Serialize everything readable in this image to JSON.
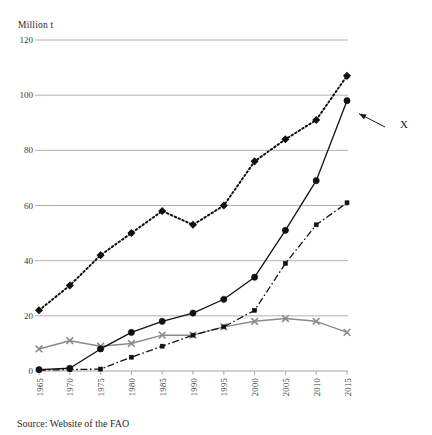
{
  "figure": {
    "unit_label": "Million t",
    "source_note": "Source: Website of the FAO",
    "annotation_label": "X"
  },
  "chart_data": {
    "type": "line",
    "title": "",
    "subtitle": "",
    "xlabel": "",
    "ylabel": "Million t",
    "ylim": [
      0,
      120
    ],
    "yticks": [
      0,
      20,
      40,
      60,
      80,
      100,
      120
    ],
    "ytick_labels": [
      "0",
      "20",
      "40",
      "60",
      "80",
      "100",
      "120"
    ],
    "grid": true,
    "grid_axis": "y",
    "legend": "none",
    "legend_position": "none",
    "x": [
      1965,
      1970,
      1975,
      1980,
      1985,
      1990,
      1995,
      2000,
      2005,
      2010,
      2015
    ],
    "categories": [
      "1965",
      "1970",
      "1975",
      "1980",
      "1985",
      "1990",
      "1995",
      "2000",
      "2005",
      "2010",
      "2015"
    ],
    "series": [
      {
        "name": "series-dotted-diamond",
        "marker": "diamond",
        "line_style": "dotted",
        "color": "#111111",
        "values": [
          22,
          31,
          42,
          50,
          58,
          53,
          60,
          76,
          84,
          91,
          107
        ]
      },
      {
        "name": "series-solid-circle",
        "marker": "circle",
        "line_style": "solid",
        "color": "#111111",
        "annotated": true,
        "values": [
          0.5,
          1,
          8,
          14,
          18,
          21,
          26,
          34,
          51,
          69,
          98
        ]
      },
      {
        "name": "series-dashdot-square",
        "marker": "square",
        "line_style": "dash-dot",
        "color": "#111111",
        "values": [
          0.3,
          0.5,
          0.7,
          5,
          9,
          13,
          16,
          22,
          39,
          53,
          61
        ]
      },
      {
        "name": "series-gray-cross",
        "marker": "x",
        "line_style": "solid",
        "color": "#8a8a8a",
        "values": [
          8,
          11,
          9,
          10,
          13,
          13,
          16,
          18,
          19,
          18,
          14
        ]
      }
    ],
    "annotations": [
      {
        "text": "X",
        "points_to_series": "series-solid-circle",
        "points_to_x": 2015,
        "points_to_value": 98
      }
    ]
  }
}
